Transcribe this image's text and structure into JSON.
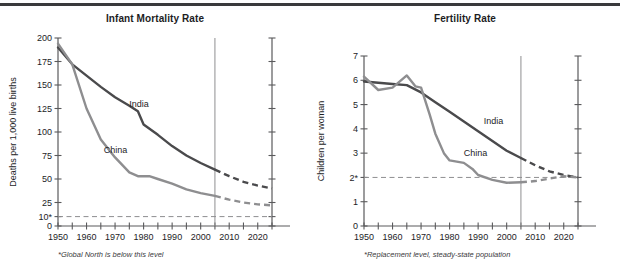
{
  "figure": {
    "top_rule_color": "#3a3a3c",
    "background": "#ffffff"
  },
  "colors": {
    "india": "#4a4a4c",
    "china": "#8e8e90",
    "axis": "#5a5a5c",
    "divider": "#8e8e90",
    "reference": "#8e8e90",
    "text": "#1d1d1f"
  },
  "panels": {
    "left": {
      "title": "Infant Mortality Rate",
      "footnote": "*Global North is below this level",
      "ylabel": "Deaths per 1,000 live births"
    },
    "right": {
      "title": "Fertility Rate",
      "footnote": "*Replacement level, steady-state population",
      "ylabel": "Children per woman"
    }
  },
  "chart_data": [
    {
      "id": "infant-mortality",
      "type": "line",
      "title": "Infant Mortality Rate",
      "xlabel": "",
      "ylabel": "Deaths per 1,000 live births",
      "xlim": [
        1950,
        2025
      ],
      "ylim": [
        0,
        200
      ],
      "xticks": [
        1950,
        1955,
        1960,
        1965,
        1970,
        1975,
        1980,
        1985,
        1990,
        1995,
        2000,
        2005,
        2010,
        2015,
        2020,
        2025
      ],
      "xtick_labels": [
        "1950",
        "",
        "1960",
        "",
        "1970",
        "",
        "1980",
        "",
        "1990",
        "",
        "2000",
        "",
        "2010",
        "",
        "2020",
        ""
      ],
      "yticks": [
        0,
        10,
        25,
        50,
        75,
        100,
        125,
        150,
        175,
        200
      ],
      "ytick_labels": [
        "0",
        "10*",
        "25",
        "50",
        "75",
        "100",
        "125",
        "150",
        "175",
        "200"
      ],
      "grid": false,
      "legend": "inline-annotation",
      "projection_start": 2005,
      "reference_line": {
        "value": 10,
        "label": "10*",
        "style": "dashed"
      },
      "series": [
        {
          "name": "India",
          "color": "#4a4a4c",
          "label_x": 1975,
          "label_y": 127,
          "observed": [
            {
              "x": 1950,
              "y": 190
            },
            {
              "x": 1955,
              "y": 172
            },
            {
              "x": 1960,
              "y": 160
            },
            {
              "x": 1965,
              "y": 148
            },
            {
              "x": 1970,
              "y": 137
            },
            {
              "x": 1975,
              "y": 128
            },
            {
              "x": 1978,
              "y": 122
            },
            {
              "x": 1980,
              "y": 108
            },
            {
              "x": 1985,
              "y": 97
            },
            {
              "x": 1990,
              "y": 85
            },
            {
              "x": 1995,
              "y": 75
            },
            {
              "x": 2000,
              "y": 67
            },
            {
              "x": 2005,
              "y": 60
            }
          ],
          "projected": [
            {
              "x": 2005,
              "y": 60
            },
            {
              "x": 2010,
              "y": 53
            },
            {
              "x": 2015,
              "y": 47
            },
            {
              "x": 2020,
              "y": 43
            },
            {
              "x": 2025,
              "y": 40
            }
          ]
        },
        {
          "name": "China",
          "color": "#8e8e90",
          "label_x": 1966,
          "label_y": 78,
          "observed": [
            {
              "x": 1950,
              "y": 194
            },
            {
              "x": 1955,
              "y": 172
            },
            {
              "x": 1960,
              "y": 125
            },
            {
              "x": 1965,
              "y": 92
            },
            {
              "x": 1970,
              "y": 73
            },
            {
              "x": 1975,
              "y": 57
            },
            {
              "x": 1978,
              "y": 53
            },
            {
              "x": 1982,
              "y": 53
            },
            {
              "x": 1985,
              "y": 50
            },
            {
              "x": 1990,
              "y": 45
            },
            {
              "x": 1995,
              "y": 39
            },
            {
              "x": 2000,
              "y": 35
            },
            {
              "x": 2005,
              "y": 32
            }
          ],
          "projected": [
            {
              "x": 2005,
              "y": 32
            },
            {
              "x": 2010,
              "y": 28
            },
            {
              "x": 2015,
              "y": 25
            },
            {
              "x": 2020,
              "y": 23
            },
            {
              "x": 2025,
              "y": 22
            }
          ]
        }
      ]
    },
    {
      "id": "fertility-rate",
      "type": "line",
      "title": "Fertility Rate",
      "xlabel": "",
      "ylabel": "Children per woman",
      "xlim": [
        1950,
        2025
      ],
      "ylim": [
        0,
        7
      ],
      "xticks": [
        1950,
        1955,
        1960,
        1965,
        1970,
        1975,
        1980,
        1985,
        1990,
        1995,
        2000,
        2005,
        2010,
        2015,
        2020,
        2025
      ],
      "xtick_labels": [
        "1950",
        "",
        "1960",
        "",
        "1970",
        "",
        "1980",
        "",
        "1990",
        "",
        "2000",
        "",
        "2010",
        "",
        "2020",
        ""
      ],
      "yticks": [
        0,
        1,
        2,
        3,
        4,
        5,
        6,
        7
      ],
      "ytick_labels": [
        "0",
        "1",
        "2*",
        "3",
        "4",
        "5",
        "6",
        "7"
      ],
      "grid": false,
      "legend": "inline-annotation",
      "projection_start": 2005,
      "reference_line": {
        "value": 2,
        "label": "2*",
        "style": "dashed"
      },
      "series": [
        {
          "name": "India",
          "color": "#4a4a4c",
          "label_x": 1992,
          "label_y": 4.2,
          "observed": [
            {
              "x": 1950,
              "y": 5.95
            },
            {
              "x": 1955,
              "y": 5.9
            },
            {
              "x": 1960,
              "y": 5.85
            },
            {
              "x": 1965,
              "y": 5.8
            },
            {
              "x": 1970,
              "y": 5.5
            },
            {
              "x": 1975,
              "y": 5.1
            },
            {
              "x": 1980,
              "y": 4.7
            },
            {
              "x": 1985,
              "y": 4.3
            },
            {
              "x": 1990,
              "y": 3.9
            },
            {
              "x": 1995,
              "y": 3.5
            },
            {
              "x": 2000,
              "y": 3.1
            },
            {
              "x": 2005,
              "y": 2.8
            }
          ],
          "projected": [
            {
              "x": 2005,
              "y": 2.8
            },
            {
              "x": 2010,
              "y": 2.5
            },
            {
              "x": 2015,
              "y": 2.25
            },
            {
              "x": 2020,
              "y": 2.1
            },
            {
              "x": 2025,
              "y": 2.0
            }
          ]
        },
        {
          "name": "China",
          "color": "#8e8e90",
          "label_x": 1985,
          "label_y": 2.9,
          "observed": [
            {
              "x": 1950,
              "y": 6.15
            },
            {
              "x": 1955,
              "y": 5.6
            },
            {
              "x": 1960,
              "y": 5.7
            },
            {
              "x": 1965,
              "y": 6.2
            },
            {
              "x": 1968,
              "y": 5.75
            },
            {
              "x": 1970,
              "y": 5.7
            },
            {
              "x": 1973,
              "y": 4.6
            },
            {
              "x": 1975,
              "y": 3.8
            },
            {
              "x": 1978,
              "y": 3.0
            },
            {
              "x": 1980,
              "y": 2.7
            },
            {
              "x": 1985,
              "y": 2.6
            },
            {
              "x": 1988,
              "y": 2.35
            },
            {
              "x": 1990,
              "y": 2.1
            },
            {
              "x": 1995,
              "y": 1.9
            },
            {
              "x": 2000,
              "y": 1.78
            },
            {
              "x": 2005,
              "y": 1.8
            }
          ],
          "projected": [
            {
              "x": 2005,
              "y": 1.8
            },
            {
              "x": 2010,
              "y": 1.85
            },
            {
              "x": 2015,
              "y": 1.95
            },
            {
              "x": 2020,
              "y": 2.05
            },
            {
              "x": 2025,
              "y": 2.0
            }
          ]
        }
      ]
    }
  ]
}
